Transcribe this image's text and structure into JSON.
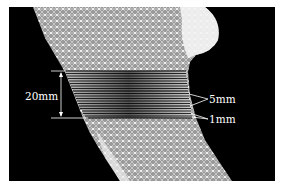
{
  "figure": {
    "type": "finite-element mesh of bone segment with slice annotation",
    "background_color": "#000000",
    "mesh_color": "#d8d8d8",
    "annotation_color": "#ffffff",
    "annotations": {
      "height_label": "20mm",
      "spacing_label_large": "5mm",
      "spacing_label_small": "1mm"
    },
    "slice_band": {
      "description": "stack of horizontal section lines across the mesh",
      "total_height_mm": 20,
      "line_count": 21
    }
  }
}
